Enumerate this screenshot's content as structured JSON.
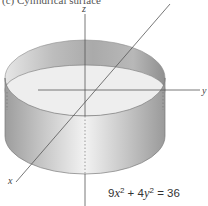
{
  "figure": {
    "title": "(c) Cylindrical surface",
    "axes": {
      "x_label": "x",
      "y_label": "y",
      "z_label": "z"
    },
    "equation": {
      "coef_x": "9",
      "var_x": "x",
      "exp": "2",
      "plus": " + ",
      "coef_y": "4",
      "var_y": "y",
      "equals": " = 36"
    },
    "colors": {
      "surface_dark": "#a9a9a9",
      "surface_light": "#ececec",
      "axis": "#555555",
      "floor": "#efefef"
    }
  }
}
